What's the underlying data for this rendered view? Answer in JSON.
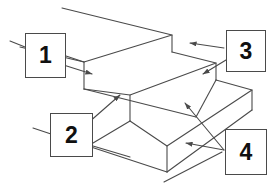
{
  "diagram": {
    "line_color": "#4a4a4a",
    "background_color": "#ffffff",
    "callouts": [
      {
        "id": "1",
        "label": "1",
        "position": "upper-left",
        "arrows": 1,
        "leader_stub": "left"
      },
      {
        "id": "2",
        "label": "2",
        "position": "lower-left",
        "arrows": 1,
        "leader_stub": "left"
      },
      {
        "id": "3",
        "label": "3",
        "position": "upper-right",
        "arrows": 2,
        "leader_stub": "none"
      },
      {
        "id": "4",
        "label": "4",
        "position": "lower-right",
        "arrows": 2,
        "leader_stub": "none"
      }
    ],
    "shape": {
      "name": "two-step staircase block",
      "steps": 2,
      "projection": "isometric"
    }
  }
}
